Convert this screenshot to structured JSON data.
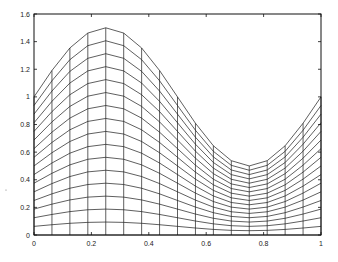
{
  "chart_data": {
    "type": "line",
    "title": "",
    "xlabel": "",
    "ylabel": "",
    "xlim": [
      0,
      1
    ],
    "ylim": [
      0,
      1.6
    ],
    "grid": false,
    "legend": null,
    "x_ticks": [
      "0",
      "0.2",
      "0.4",
      "0.6",
      "0.8",
      "1"
    ],
    "x_tick_values": [
      0,
      0.2,
      0.4,
      0.6,
      0.8,
      1
    ],
    "y_ticks": [
      "0",
      "0.2",
      "0.4",
      "0.6",
      "0.8",
      "1",
      "1.2",
      "1.4",
      "1.6"
    ],
    "y_tick_values": [
      0,
      0.2,
      0.4,
      0.6,
      0.8,
      1,
      1.2,
      1.4,
      1.6
    ],
    "x": [
      0,
      0.0625,
      0.125,
      0.1875,
      0.25,
      0.3125,
      0.375,
      0.4375,
      0.5,
      0.5625,
      0.625,
      0.6875,
      0.75,
      0.8125,
      0.875,
      0.9375,
      1
    ],
    "top_curve": [
      1.0,
      1.191,
      1.354,
      1.462,
      1.5,
      1.462,
      1.354,
      1.191,
      1.0,
      0.809,
      0.646,
      0.538,
      0.5,
      0.538,
      0.646,
      0.809,
      1.0
    ],
    "levels": 16,
    "series_note": "Each level k (1..16) has values top_curve * k/16"
  },
  "plot": {
    "left_px": 34,
    "right_px": 321,
    "top_px": 14,
    "bottom_px": 235
  }
}
